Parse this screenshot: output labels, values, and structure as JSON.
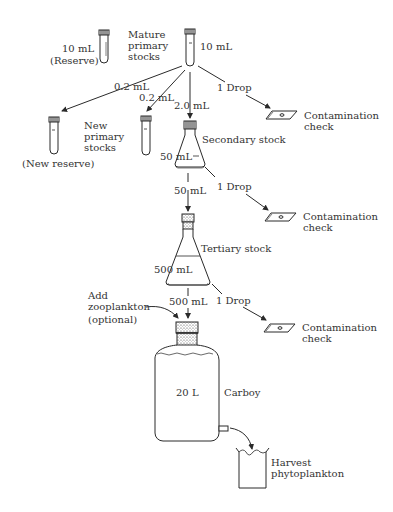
{
  "diagram": {
    "type": "flowchart"
  },
  "labels": {
    "reserve_volume": "10 mL",
    "reserve": "(Reserve)",
    "mature_primary": [
      "Mature",
      "primary",
      "stocks"
    ],
    "mature_volume": "10 mL",
    "transfer_reserve": "0.2 mL",
    "transfer_primary": "0.2 mL",
    "transfer_secondary": "2.0 mL",
    "drop_1": "1 Drop",
    "contam_1": [
      "Contamination",
      "check"
    ],
    "new_primary": [
      "New",
      "primary",
      "stocks"
    ],
    "new_reserve": "(New reserve)",
    "secondary_stock": "Secondary stock",
    "secondary_volume": "50 mL",
    "transfer_tertiary": "50 mL",
    "drop_2": "1 Drop",
    "contam_2": [
      "Contamination",
      "check"
    ],
    "tertiary_stock": "Tertiary stock",
    "tertiary_volume": "500 mL",
    "transfer_carboy": "500 mL",
    "drop_3": "1 Drop",
    "contam_3": [
      "Contamination",
      "check"
    ],
    "add_zoo": [
      "Add",
      "zooplankton",
      "(optional)"
    ],
    "carboy_volume": "20 L",
    "carboy": "Carboy",
    "harvest": [
      "Harvest",
      "phytoplankton"
    ]
  },
  "colors": {
    "ink": "#2a2a2a",
    "background": "#ffffff"
  }
}
